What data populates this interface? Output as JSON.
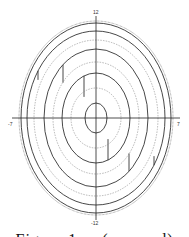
{
  "figure": {
    "type": "concentric-ellipse-diagram",
    "center": [
      96,
      118
    ],
    "axes": {
      "x_min_label": "-7",
      "x_max_label": "7",
      "y_max_label": "12",
      "y_min_label": "-12"
    },
    "ellipses": [
      {
        "rx": 77,
        "ry": 97,
        "style": "dotted",
        "color": "#555555"
      },
      {
        "rx": 75,
        "ry": 95,
        "style": "solid",
        "color": "#333333"
      },
      {
        "rx": 69,
        "ry": 87,
        "style": "solid",
        "color": "#333333",
        "step": {
          "x_offset": -58,
          "shift": 3
        }
      },
      {
        "rx": 62,
        "ry": 78,
        "style": "dashed",
        "color": "#888888"
      },
      {
        "rx": 52,
        "ry": 69,
        "style": "solid",
        "color": "#333333",
        "step": {
          "x_offset": -33,
          "shift": 6
        }
      },
      {
        "rx": 43,
        "ry": 56,
        "style": "dashed",
        "color": "#888888"
      },
      {
        "rx": 34,
        "ry": 45,
        "style": "solid",
        "color": "#333333",
        "step": {
          "x_offset": -12,
          "shift": 7
        }
      },
      {
        "rx": 25,
        "ry": 30,
        "style": "dashed",
        "color": "#888888"
      },
      {
        "rx": 11,
        "ry": 15,
        "style": "solid",
        "color": "#333333"
      }
    ]
  },
  "caption": "Figure 1 ... (cropped)"
}
